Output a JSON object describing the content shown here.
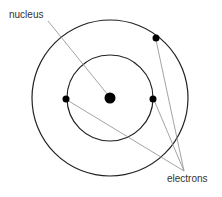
{
  "diagram": {
    "labels": {
      "nucleus": "nucleus",
      "electrons": "electrons"
    },
    "colors": {
      "stroke": "#222222",
      "leader": "#999999",
      "fill": "#000000",
      "text": "#333333"
    },
    "nucleus": {
      "cx": 110,
      "cy": 98,
      "r": 5.5
    },
    "orbits": [
      {
        "name": "inner-orbit",
        "cx": 110,
        "cy": 98,
        "r": 43
      },
      {
        "name": "outer-orbit",
        "cx": 110,
        "cy": 98,
        "r": 78
      }
    ],
    "electrons": [
      {
        "cx": 66,
        "cy": 99,
        "r": 3.5
      },
      {
        "cx": 153,
        "cy": 99,
        "r": 3.5
      },
      {
        "cx": 156,
        "cy": 38,
        "r": 3.5
      }
    ]
  }
}
